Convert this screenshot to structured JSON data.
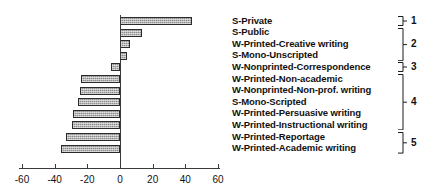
{
  "chart_data": {
    "type": "bar",
    "orientation": "horizontal",
    "title": "",
    "xlabel": "",
    "ylabel": "",
    "xlim": [
      -60,
      60
    ],
    "xticks": [
      -60,
      -40,
      -20,
      0,
      20,
      40,
      60
    ],
    "xtick_labels": [
      "-60",
      "-40",
      "-20",
      "0",
      "20",
      "40",
      "60"
    ],
    "grid": false,
    "legend": false,
    "categories": [
      "S-Private",
      "S-Public",
      "W-Printed-Creative writing",
      "S-Mono-Unscripted",
      "W-Nonprinted-Correspondence",
      "W-Printed-Non-academic",
      "W-Nonprinted-Non-prof. writing",
      "S-Mono-Scripted",
      "W-Printed-Persuasive writing",
      "W-Printed-Instructional writing",
      "W-Printed-Reportage",
      "W-Printed-Academic writing"
    ],
    "values": [
      44,
      13.5,
      6,
      4.5,
      -5.5,
      -24,
      -24.5,
      -25.5,
      -28.5,
      -29.5,
      -33,
      -36
    ],
    "bar_color": "#8d8d8d",
    "bar_edge_color": "#2b2b2b"
  },
  "groups": [
    {
      "label": "1",
      "members": [
        "S-Private"
      ]
    },
    {
      "label": "2",
      "members": [
        "S-Public",
        "W-Printed-Creative writing",
        "S-Mono-Unscripted"
      ]
    },
    {
      "label": "3",
      "members": [
        "W-Nonprinted-Correspondence"
      ]
    },
    {
      "label": "4",
      "members": [
        "W-Printed-Non-academic",
        "W-Nonprinted-Non-prof. writing",
        "S-Mono-Scripted",
        "W-Printed-Persuasive writing",
        "W-Printed-Instructional writing"
      ]
    },
    {
      "label": "5",
      "members": [
        "W-Printed-Reportage",
        "W-Printed-Academic writing"
      ]
    }
  ],
  "axis": {
    "ticks": [
      {
        "value": -60,
        "label": "-60"
      },
      {
        "value": -40,
        "label": "-40"
      },
      {
        "value": -20,
        "label": "-20"
      },
      {
        "value": 0,
        "label": "0"
      },
      {
        "value": 20,
        "label": "20"
      },
      {
        "value": 40,
        "label": "40"
      },
      {
        "value": 60,
        "label": "60"
      }
    ]
  }
}
